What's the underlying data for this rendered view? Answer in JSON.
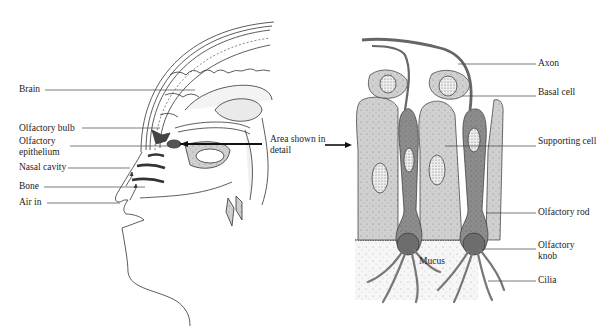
{
  "head_diagram": {
    "labels": [
      {
        "text": "Brain"
      },
      {
        "text": "Olfactory bulb"
      },
      {
        "text": "Olfactory epithelium"
      },
      {
        "text": "Nasal cavity"
      },
      {
        "text": "Bone"
      },
      {
        "text": "Air in"
      }
    ],
    "callout": "Area shown in detail"
  },
  "detail_diagram": {
    "labels": [
      {
        "text": "Axon"
      },
      {
        "text": "Basal cell"
      },
      {
        "text": "Supporting cell"
      },
      {
        "text": "Olfactory rod"
      },
      {
        "text": "Olfactory knob"
      },
      {
        "text": "Cilia"
      }
    ],
    "region_label": "Mucus"
  },
  "colors": {
    "line": "#333333",
    "supporting_cell": "#c9c9c9",
    "receptor_cell": "#8f8f8f",
    "mucus": "#eeeeee"
  }
}
